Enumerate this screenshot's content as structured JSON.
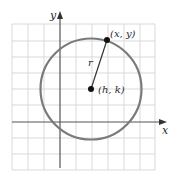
{
  "diagram": {
    "labels": {
      "y_axis": "y",
      "x_axis": "x",
      "point_on_circle": "(x, y)",
      "center": "(h, k)",
      "radius": "r"
    },
    "colors": {
      "grid": "#d9d9d9",
      "axes": "#555555",
      "circle": "#7a7a7a",
      "points": "#111111",
      "radius_line": "#333333"
    },
    "geometry": {
      "grid_spacing_px": 16,
      "center_px": [
        91,
        89
      ],
      "radius_px": 50.5,
      "point_px": [
        107,
        40
      ],
      "x_axis_y_px": 122,
      "y_axis_x_px": 60
    }
  }
}
